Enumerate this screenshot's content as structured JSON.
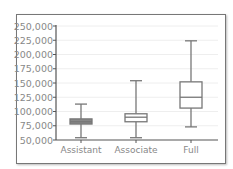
{
  "chart_data": {
    "type": "box",
    "title": "",
    "xlabel": "",
    "ylabel": "",
    "ylim": [
      50000,
      250000
    ],
    "yticks": [
      "250,000",
      "225,000",
      "200,000",
      "175,000",
      "150,000",
      "125,000",
      "100,000",
      "75,000",
      "50,000"
    ],
    "grid": true,
    "categories": [
      "Assistant",
      "Associate",
      "Full"
    ],
    "boxes": [
      {
        "name": "Assistant",
        "min": 54000,
        "q1": 78000,
        "median": 82000,
        "q3": 87000,
        "max": 113000
      },
      {
        "name": "Associate",
        "min": 54000,
        "q1": 82000,
        "median": 90000,
        "q3": 96000,
        "max": 154000
      },
      {
        "name": "Full",
        "min": 73000,
        "q1": 106000,
        "median": 125000,
        "q3": 152000,
        "max": 224000
      }
    ],
    "colors": {
      "box_line": "#777777",
      "assistant_fill": "#888888",
      "grid": "#eeeeee"
    }
  }
}
